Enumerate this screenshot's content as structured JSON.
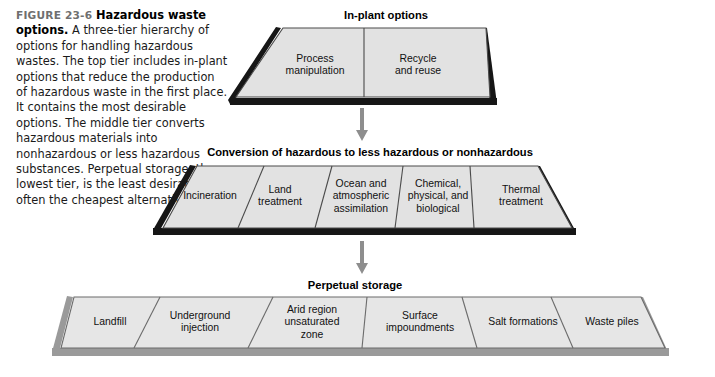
{
  "caption": {
    "figure_number": "FIGURE 23-6",
    "title": "Hazardous waste options.",
    "body": " A three-tier hierarchy of options for handling hazardous wastes. The top tier includes in-plant options that reduce the production of hazardous waste in the first place. It contains the most desirable options. The middle tier converts hazardous materials into nonhazardous or less hazardous substances. Perpetual storage, the lowest tier, is the least desirable but often the cheapest alternative."
  },
  "colors": {
    "face": "#e2e2e2",
    "face_bottom": "#e6e6e6",
    "outline": "#4a4a4a",
    "shadow_dark": "#161616",
    "shadow_gray": "#9a9a9a",
    "arrow": "#8e8e8e",
    "caption_label": "#6f6f6f"
  },
  "tiers": [
    {
      "id": "in-plant",
      "heading": "In-plant options",
      "cells": [
        {
          "label": "Process\nmanipulation"
        },
        {
          "label": "Recycle\nand reuse"
        }
      ]
    },
    {
      "id": "conversion",
      "heading": "Conversion of hazardous to less hazardous or nonhazardous",
      "cells": [
        {
          "label": "Incineration"
        },
        {
          "label": "Land\ntreatment"
        },
        {
          "label": "Ocean and\natmospheric\nassimilation"
        },
        {
          "label": "Chemical,\nphysical, and\nbiological"
        },
        {
          "label": "Thermal\ntreatment"
        }
      ]
    },
    {
      "id": "perpetual",
      "heading": "Perpetual storage",
      "cells": [
        {
          "label": "Landfill"
        },
        {
          "label": "Underground\ninjection"
        },
        {
          "label": "Arid region\nunsaturated\nzone"
        },
        {
          "label": "Surface\nimpoundments"
        },
        {
          "label": "Salt formations"
        },
        {
          "label": "Waste piles"
        }
      ]
    }
  ],
  "arrows": [
    {
      "id": "arrow-top-to-middle"
    },
    {
      "id": "arrow-middle-to-bottom"
    }
  ]
}
